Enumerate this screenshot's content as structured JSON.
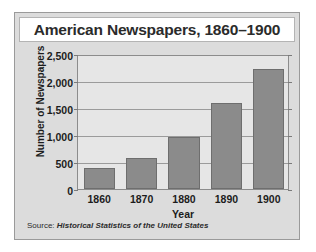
{
  "figure": {
    "title": "American Newspapers, 1860–1900",
    "source_prefix": "Source:",
    "source_title": "Historical Statistics of the United States",
    "bar_color": "#8b8b8b",
    "panel_color": "#dcdcdc",
    "plot_color": "#e6e6e6",
    "grid_color": "#9b9b9b",
    "text_color": "#1c1c1c"
  },
  "chart_data": {
    "type": "bar",
    "title": "American Newspapers, 1860–1900",
    "xlabel": "Year",
    "ylabel": "Number of Newspapers",
    "categories": [
      "1860",
      "1870",
      "1880",
      "1890",
      "1900"
    ],
    "values": [
      390,
      570,
      965,
      1600,
      2220
    ],
    "ylim": [
      0,
      2500
    ],
    "yticks": [
      0,
      500,
      1000,
      1500,
      2000,
      2500
    ],
    "ytick_labels": [
      "0",
      "500",
      "1,000",
      "1,500",
      "2,000",
      "2,500"
    ],
    "grid": true,
    "legend": "none",
    "series": [
      {
        "name": "Number of Newspapers",
        "values": [
          390,
          570,
          965,
          1600,
          2220
        ]
      }
    ],
    "annotations": [
      "Source: Historical Statistics of the United States"
    ]
  }
}
